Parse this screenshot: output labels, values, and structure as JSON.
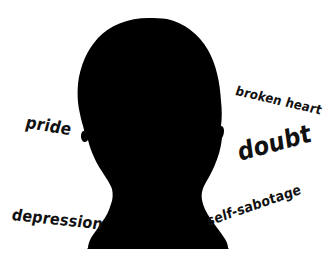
{
  "image": {
    "title": "Black head silhouette surrounded by handwritten emotion words",
    "background_color": "#ffffff",
    "silhouette_color": "#000000",
    "text_color": "#111111",
    "width": 335,
    "height": 266
  },
  "subject": {
    "name": "head-silhouette",
    "description": "Solid black front-facing bust silhouette: rounded crown, slight ear bumps on both sides, tapering neck, flared shoulders"
  },
  "labels": [
    {
      "id": "pride",
      "text": "pride",
      "position": "left-upper",
      "rotation_deg": 9,
      "font_size": 17
    },
    {
      "id": "broken-heart",
      "text": "broken heart",
      "position": "right-upper",
      "rotation_deg": 13,
      "font_size": 13
    },
    {
      "id": "doubt",
      "text": "doubt",
      "position": "right-middle",
      "rotation_deg": -15,
      "font_size": 25
    },
    {
      "id": "depression",
      "text": "depression",
      "position": "left-lower",
      "rotation_deg": 6,
      "font_size": 16
    },
    {
      "id": "self-sabotage",
      "text": "self-sabotage",
      "position": "right-lower",
      "rotation_deg": -19,
      "font_size": 14
    }
  ]
}
